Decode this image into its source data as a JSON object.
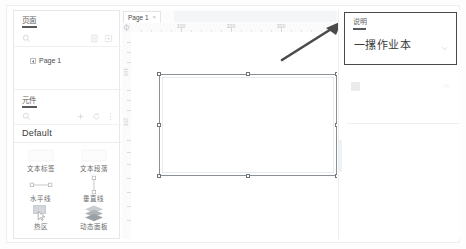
{
  "app": {
    "name": "Axure RP Prototype Editor"
  },
  "pages_panel": {
    "title": "页面",
    "search_placeholder": "",
    "icons": [
      {
        "name": "search-icon",
        "glyph": "search"
      },
      {
        "name": "list-view-icon",
        "glyph": "list"
      },
      {
        "name": "add-page-icon",
        "glyph": "page-add"
      }
    ],
    "tree": [
      {
        "label": "Page 1",
        "expandable": true
      }
    ]
  },
  "widgets_panel": {
    "title": "元件",
    "icons": [
      {
        "name": "search-icon",
        "glyph": "search"
      },
      {
        "name": "add-library-icon",
        "glyph": "plus"
      },
      {
        "name": "refresh-library-icon",
        "glyph": "refresh"
      },
      {
        "name": "library-options-icon",
        "glyph": "more"
      }
    ],
    "library_name": "Default",
    "widgets": [
      {
        "label": "文本标签",
        "icon": "text-label-icon"
      },
      {
        "label": "文本段落",
        "icon": "text-paragraph-icon"
      },
      {
        "label": "水平线",
        "icon": "horizontal-line-icon"
      },
      {
        "label": "垂直线",
        "icon": "vertical-line-icon"
      },
      {
        "label": "热区",
        "icon": "hotspot-icon"
      },
      {
        "label": "动态面板",
        "icon": "dynamic-panel-icon"
      }
    ]
  },
  "canvas": {
    "tab": {
      "label": "Page 1",
      "close_glyph": "×"
    },
    "ruler": {
      "horizontal_labels": [
        "100",
        "200",
        "300"
      ],
      "vertical_labels": [
        "100",
        "200"
      ],
      "unit": "px"
    },
    "selection": {
      "name": "selected-shape",
      "handles": 8,
      "border_color": "#8b9096"
    },
    "annotation": {
      "name": "pointer-arrow",
      "color": "#4a4a4a"
    }
  },
  "inspector": {
    "title": "说明",
    "value": "一摞作业本",
    "chevron_glyph": "chevron-down"
  },
  "colors": {
    "panel_border": "#e6e8ea",
    "text_primary": "#3a3a3a",
    "text_secondary": "#6b6b6b",
    "accent_dark": "#4a4a4a",
    "selection": "#8b9096",
    "canvas_bg": "#ffffff"
  }
}
